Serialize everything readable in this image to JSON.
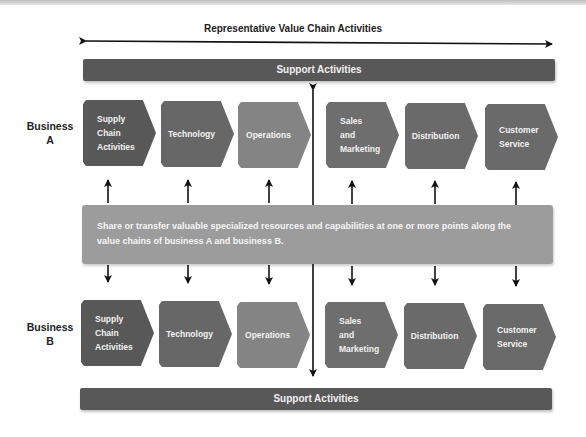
{
  "title": "Representative Value Chain Activities",
  "support_top": "Support Activities",
  "support_bottom": "Support Activities",
  "business_a": {
    "label_line1": "Business",
    "label_line2": "A"
  },
  "business_b": {
    "label_line1": "Business",
    "label_line2": "B"
  },
  "activities": [
    {
      "label": "Supply\nChain\nActivities",
      "color": "#585858"
    },
    {
      "label": "Technology",
      "color": "#676767"
    },
    {
      "label": "Operations",
      "color": "#848484"
    },
    {
      "label": "Sales\nand\nMarketing",
      "color": "#6e6e6e"
    },
    {
      "label": "Distribution",
      "color": "#6a6a6a"
    },
    {
      "label": "Customer\nService",
      "color": "#6a6a6a"
    }
  ],
  "shared_panel": "Share or transfer valuable specialized resources and capabilities at one or more points along the value chains of business A and business B."
}
